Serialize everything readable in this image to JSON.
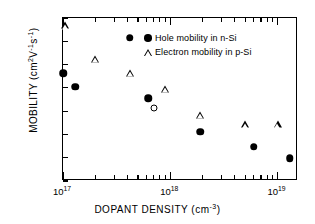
{
  "chart_data": {
    "type": "scatter",
    "title": "",
    "xlabel": "DOPANT DENSITY (cm-3)",
    "ylabel": "MOBILITY (cm2V-1s-1)",
    "xscale": "log",
    "yscale": "linear",
    "xlim": [
      1e+17,
      1.55e+19
    ],
    "ylim": [
      0,
      700
    ],
    "grid": false,
    "legend_position": "top-right",
    "xticks": [
      {
        "value": 1e+17,
        "label": "10",
        "exp": "17",
        "major": true
      },
      {
        "value": 1e+18,
        "label": "10",
        "exp": "18",
        "major": true
      },
      {
        "value": 1e+19,
        "label": "10",
        "exp": "19",
        "major": true
      }
    ],
    "yticks": [
      0,
      100,
      200,
      300,
      400,
      500,
      600,
      700
    ],
    "series": [
      {
        "name": "Hole mobility in n-Si",
        "marker": "filled-circle",
        "color": "#000000",
        "points": [
          {
            "x": 1e+17,
            "y": 462
          },
          {
            "x": 1.3e+17,
            "y": 405
          },
          {
            "x": 4.2e+17,
            "y": 615
          },
          {
            "x": 6.2e+17,
            "y": 355
          },
          {
            "x": 1.9e+18,
            "y": 212
          },
          {
            "x": 6e+18,
            "y": 148
          },
          {
            "x": 1.3e+19,
            "y": 97
          }
        ]
      },
      {
        "name": "Electron mobility in p-Si",
        "marker": "open-triangle",
        "color": "#000000",
        "points": [
          {
            "x": 1.05e+17,
            "y": 668
          },
          {
            "x": 2e+17,
            "y": 525
          },
          {
            "x": 4.2e+17,
            "y": 463
          },
          {
            "x": 9e+17,
            "y": 397
          },
          {
            "x": 1.9e+18,
            "y": 285
          },
          {
            "x": 5e+18,
            "y": 243
          },
          {
            "x": 1e+19,
            "y": 243
          }
        ]
      },
      {
        "name": "",
        "marker": "open-circle",
        "color": "#000000",
        "points": [
          {
            "x": 7e+17,
            "y": 313
          }
        ]
      }
    ]
  },
  "axes": {
    "y_title_main": "MOBILITY (cm",
    "y_title_sup1": "2",
    "y_title_mid": "V",
    "y_title_sup2": "-1",
    "y_title_mid2": "s",
    "y_title_sup3": "-1",
    "y_title_end": ")",
    "x_title_main": "DOPANT DENSITY (cm",
    "x_title_sup": "-3",
    "x_title_end": ")"
  },
  "legend": {
    "entries": [
      {
        "marker": "filled-circle",
        "label": "Hole mobility in n-Si"
      },
      {
        "marker": "open-triangle",
        "label": "Electron mobility in p-Si"
      }
    ]
  }
}
